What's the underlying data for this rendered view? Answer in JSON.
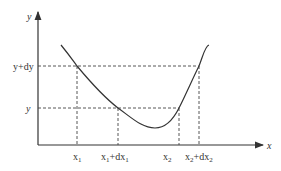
{
  "diagram": {
    "type": "function-curve-differential",
    "axes": {
      "x_label": "x",
      "y_label": "y"
    },
    "y_ticks": [
      {
        "label": "y+dy",
        "ypx": 66
      },
      {
        "label": "y",
        "ypx": 108
      }
    ],
    "x_ticks": [
      {
        "label": "x",
        "sub": "1",
        "suffix": "",
        "xpx": 77
      },
      {
        "label": "x",
        "sub": "1",
        "suffix": "+dx",
        "suffix_sub": "1",
        "xpx": 118
      },
      {
        "label": "x",
        "sub": "2",
        "suffix": "",
        "xpx": 179
      },
      {
        "label": "x",
        "sub": "2",
        "suffix": "+dx",
        "suffix_sub": "2",
        "xpx": 199
      }
    ],
    "labels": {
      "y_axis": "y",
      "x_axis": "x",
      "ytick_ydy": "y+dy",
      "ytick_y": "y",
      "x1_main": "x",
      "x1_sub": "1",
      "x1dx_main": "x",
      "x1dx_sub": "1",
      "x1dx_plus": "+dx",
      "x1dx_sub2": "1",
      "x2_main": "x",
      "x2_sub": "2",
      "x2dx_main": "x",
      "x2dx_sub": "2",
      "x2dx_plus": "+dx",
      "x2dx_sub2": "2"
    },
    "colors": {
      "line": "#333333",
      "dashed": "#444444",
      "background": "#ffffff"
    }
  }
}
